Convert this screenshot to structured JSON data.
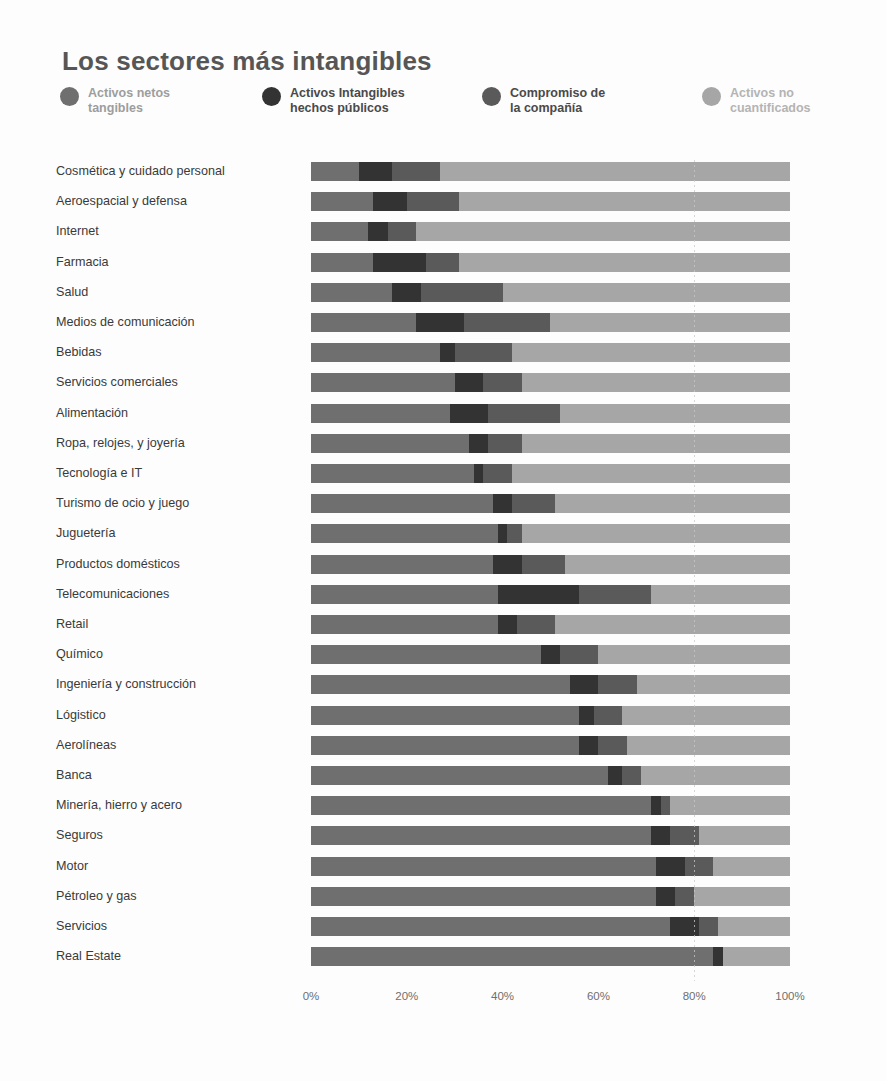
{
  "header": {
    "title": "Los sectores más intangibles"
  },
  "legend": {
    "items": [
      {
        "label": "Activos netos\ntangibles",
        "color": "#6f6f6f",
        "key": "tangibles"
      },
      {
        "label": "Activos Intangibles\nhechos públicos",
        "color": "#333333",
        "key": "intangibles_publicos"
      },
      {
        "label": "Compromiso de\nla compañía",
        "color": "#5a5a5a",
        "key": "compromiso"
      },
      {
        "label": "Activos no\ncuantificados",
        "color": "#a6a6a6",
        "key": "no_cuantificados"
      }
    ]
  },
  "axis": {
    "ticks": [
      "0%",
      "20%",
      "40%",
      "60%",
      "80%",
      "100%"
    ],
    "tick_values": [
      0,
      20,
      40,
      60,
      80,
      100
    ],
    "gridline_at": 80
  },
  "chart_data": {
    "type": "bar",
    "orientation": "horizontal",
    "stacked": true,
    "normalized": true,
    "title": "Los sectores más intangibles",
    "xlabel": "",
    "ylabel": "",
    "xlim": [
      0,
      100
    ],
    "grid": true,
    "legend_position": "top",
    "categories": [
      "Cosmética y cuidado personal",
      "Aeroespacial y defensa",
      "Internet",
      "Farmacia",
      "Salud",
      "Medios de comunicación",
      "Bebidas",
      "Servicios comerciales",
      "Alimentación",
      "Ropa, relojes, y joyería",
      "Tecnología e IT",
      "Turismo de ocio y juego",
      "Juguetería",
      "Productos domésticos",
      "Telecomunicaciones",
      "Retail",
      "Químico",
      "Ingeniería y construcción",
      "Lógistico",
      "Aerolíneas",
      "Banca",
      "Minería, hierro y acero",
      "Seguros",
      "Motor",
      "Pétroleo y gas",
      "Servicios",
      "Real Estate"
    ],
    "series": [
      {
        "name": "Activos netos tangibles",
        "color": "#6f6f6f",
        "values": [
          10,
          13,
          12,
          13,
          17,
          22,
          27,
          30,
          29,
          33,
          34,
          38,
          39,
          38,
          39,
          39,
          48,
          54,
          56,
          56,
          62,
          71,
          71,
          72,
          72,
          75,
          84
        ]
      },
      {
        "name": "Activos Intangibles hechos públicos",
        "color": "#333333",
        "values": [
          7,
          7,
          4,
          11,
          6,
          10,
          3,
          6,
          8,
          4,
          2,
          4,
          2,
          6,
          17,
          4,
          4,
          6,
          3,
          4,
          3,
          2,
          4,
          6,
          4,
          6,
          2
        ]
      },
      {
        "name": "Compromiso de la compañía",
        "color": "#5a5a5a",
        "values": [
          10,
          11,
          6,
          7,
          17,
          18,
          12,
          8,
          15,
          7,
          6,
          9,
          3,
          9,
          15,
          8,
          8,
          8,
          6,
          6,
          4,
          2,
          6,
          6,
          4,
          4,
          0
        ]
      },
      {
        "name": "Activos no cuantificados",
        "color": "#a6a6a6",
        "values": [
          73,
          69,
          78,
          69,
          60,
          50,
          58,
          56,
          48,
          56,
          58,
          49,
          56,
          47,
          29,
          49,
          40,
          32,
          35,
          34,
          31,
          25,
          19,
          16,
          20,
          15,
          14
        ]
      }
    ]
  }
}
